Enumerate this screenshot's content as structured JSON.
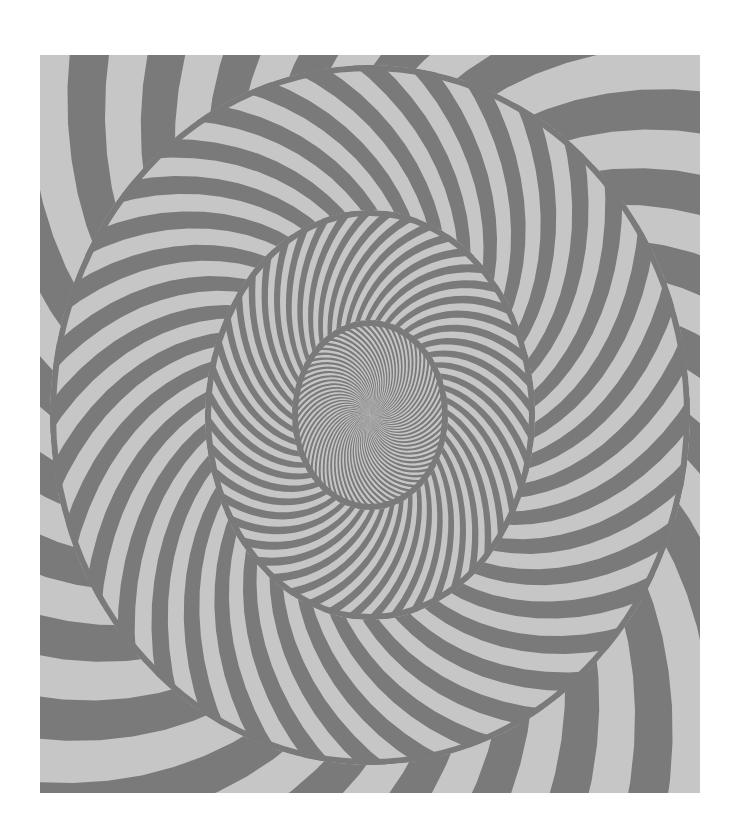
{
  "artwork": {
    "description": "Op-art concentric spiral with swirling gray and light-gray stripes",
    "colors": {
      "page": "#ffffff",
      "dark": "#7a7a7a",
      "light": "#c6c6c6"
    },
    "center": [
      330,
      360
    ],
    "rings": [
      {
        "name": "inner",
        "rx": 78,
        "ry": 95,
        "stripes": 72
      },
      {
        "name": "middle",
        "rx": 165,
        "ry": 205,
        "stripes": 48
      },
      {
        "name": "outer",
        "rx": 320,
        "ry": 350,
        "stripes": 36
      },
      {
        "name": "corner",
        "rx": 520,
        "ry": 560,
        "stripes": 24
      }
    ]
  }
}
